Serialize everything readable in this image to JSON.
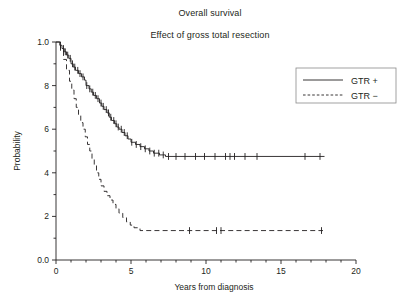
{
  "figure": {
    "title": "Overall survival",
    "subtitle": "Effect of gross total resection"
  },
  "chart_data": {
    "type": "line",
    "title": "Overall survival",
    "subtitle": "Effect of gross total resection",
    "xlabel": "Years from diagnosis",
    "ylabel": "Probability",
    "xlim": [
      0,
      20
    ],
    "ylim": [
      0.0,
      1.0
    ],
    "xticks": [
      0,
      5,
      10,
      15,
      20
    ],
    "xtick_labels": [
      "0",
      "5",
      "10",
      "15",
      "20"
    ],
    "xminor_tick_interval": 1,
    "yticks": [
      0.0,
      0.2,
      0.4,
      0.6,
      0.8,
      1.0
    ],
    "ytick_labels": [
      "0.0",
      "2",
      "4",
      "6",
      "8",
      "1.0"
    ],
    "yminor_tick_interval": 0.1,
    "grid": false,
    "legend_position": "top-right",
    "legend_box": true,
    "plot_style": "kaplan-meier step with censoring ticks",
    "series": [
      {
        "name": "GTR +",
        "legend_label": "GTR +",
        "linestyle": "solid",
        "color": "#231f20",
        "plateau_probability": 0.475,
        "last_time": 17.9,
        "steps": [
          [
            0.0,
            1.0
          ],
          [
            0.25,
            0.985
          ],
          [
            0.4,
            0.97
          ],
          [
            0.55,
            0.955
          ],
          [
            0.7,
            0.94
          ],
          [
            0.85,
            0.925
          ],
          [
            1.0,
            0.9
          ],
          [
            1.15,
            0.885
          ],
          [
            1.3,
            0.87
          ],
          [
            1.5,
            0.855
          ],
          [
            1.7,
            0.84
          ],
          [
            1.9,
            0.825
          ],
          [
            2.0,
            0.8
          ],
          [
            2.2,
            0.785
          ],
          [
            2.35,
            0.77
          ],
          [
            2.5,
            0.755
          ],
          [
            2.7,
            0.74
          ],
          [
            2.9,
            0.72
          ],
          [
            3.05,
            0.705
          ],
          [
            3.2,
            0.69
          ],
          [
            3.4,
            0.675
          ],
          [
            3.55,
            0.655
          ],
          [
            3.7,
            0.64
          ],
          [
            3.9,
            0.625
          ],
          [
            4.05,
            0.61
          ],
          [
            4.2,
            0.6
          ],
          [
            4.4,
            0.585
          ],
          [
            4.6,
            0.57
          ],
          [
            4.8,
            0.555
          ],
          [
            5.0,
            0.54
          ],
          [
            5.3,
            0.53
          ],
          [
            5.6,
            0.52
          ],
          [
            5.9,
            0.51
          ],
          [
            6.2,
            0.5
          ],
          [
            6.5,
            0.49
          ],
          [
            6.9,
            0.482
          ],
          [
            7.3,
            0.475
          ],
          [
            17.9,
            0.475
          ]
        ],
        "censor_times": [
          0.3,
          0.5,
          0.62,
          0.78,
          0.95,
          1.1,
          1.25,
          1.45,
          1.6,
          1.8,
          2.05,
          2.25,
          2.45,
          2.62,
          2.8,
          3.0,
          3.15,
          3.35,
          3.5,
          3.65,
          3.85,
          4.0,
          4.15,
          4.35,
          4.55,
          4.75,
          5.05,
          5.35,
          5.65,
          5.95,
          6.25,
          6.55,
          6.85,
          7.15,
          7.5,
          8.0,
          8.6,
          9.3,
          9.9,
          10.6,
          11.3,
          11.6,
          11.9,
          12.6,
          13.4,
          16.6,
          17.6
        ]
      },
      {
        "name": "GTR −",
        "legend_label": "GTR −",
        "linestyle": "dashed",
        "color": "#231f20",
        "plateau_probability": 0.135,
        "last_time": 17.8,
        "steps": [
          [
            0.0,
            1.0
          ],
          [
            0.3,
            0.96
          ],
          [
            0.5,
            0.92
          ],
          [
            0.7,
            0.87
          ],
          [
            0.9,
            0.82
          ],
          [
            1.05,
            0.78
          ],
          [
            1.2,
            0.74
          ],
          [
            1.35,
            0.7
          ],
          [
            1.5,
            0.665
          ],
          [
            1.65,
            0.63
          ],
          [
            1.8,
            0.6
          ],
          [
            1.95,
            0.565
          ],
          [
            2.1,
            0.53
          ],
          [
            2.25,
            0.5
          ],
          [
            2.4,
            0.465
          ],
          [
            2.55,
            0.435
          ],
          [
            2.7,
            0.4
          ],
          [
            2.85,
            0.37
          ],
          [
            3.0,
            0.34
          ],
          [
            3.2,
            0.315
          ],
          [
            3.4,
            0.295
          ],
          [
            3.6,
            0.275
          ],
          [
            3.8,
            0.255
          ],
          [
            4.0,
            0.235
          ],
          [
            4.2,
            0.215
          ],
          [
            4.45,
            0.195
          ],
          [
            4.7,
            0.175
          ],
          [
            4.95,
            0.16
          ],
          [
            5.2,
            0.148
          ],
          [
            5.6,
            0.135
          ],
          [
            17.8,
            0.135
          ]
        ],
        "censor_times": [
          8.9,
          10.7,
          11.0,
          17.7
        ]
      }
    ]
  }
}
